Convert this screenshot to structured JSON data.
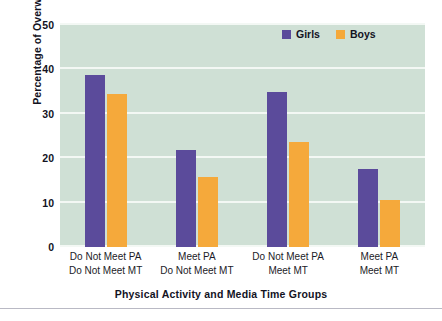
{
  "figure": {
    "scan_remnant_text": "",
    "panel_background": "#cfe0d5",
    "gridline_color": "#f3f8f4"
  },
  "legend": {
    "position": "top-right",
    "entries": [
      {
        "label": "Girls",
        "color": "#5b4b9b",
        "swatch_icon": "square-swatch-icon"
      },
      {
        "label": "Boys",
        "color": "#f5a93b",
        "swatch_icon": "square-swatch-icon"
      }
    ]
  },
  "axes": {
    "y_title": "Percentage of Overweight (%)",
    "y_ticks": [
      "0",
      "10",
      "20",
      "30",
      "40",
      "50"
    ],
    "x_title": "Physical Activity and Media Time Groups"
  },
  "chart_data": {
    "type": "bar",
    "title": "",
    "xlabel": "Physical Activity and Media Time Groups",
    "ylabel": "Percentage of Overweight (%)",
    "ylim": [
      0,
      50
    ],
    "yticks": [
      0,
      10,
      20,
      30,
      40,
      50
    ],
    "grid": true,
    "legend_position": "top-right",
    "categories": [
      "Do Not Meet PA\nDo Not Meet MT",
      "Meet PA\nDo Not Meet MT",
      "Do Not Meet PA\nMeet MT",
      "Meet PA\nMeet MT"
    ],
    "category_lines": [
      [
        "Do Not Meet PA",
        "Do Not Meet MT"
      ],
      [
        "Meet PA",
        "Do Not Meet MT"
      ],
      [
        "Do Not Meet PA",
        "Meet MT"
      ],
      [
        "Meet PA",
        "Meet MT"
      ]
    ],
    "series": [
      {
        "name": "Girls",
        "color": "#5b4b9b",
        "values": [
          38.8,
          21.8,
          35.0,
          17.6
        ]
      },
      {
        "name": "Boys",
        "color": "#f5a93b",
        "values": [
          34.4,
          15.8,
          23.7,
          10.7
        ]
      }
    ]
  }
}
